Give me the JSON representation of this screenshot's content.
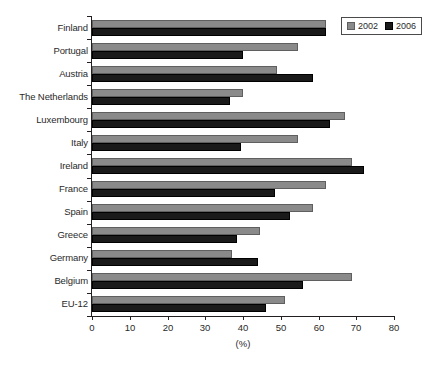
{
  "chart_data": {
    "type": "bar",
    "orientation": "horizontal",
    "title": "",
    "xlabel": "(%)",
    "ylabel": "",
    "xlim": [
      0,
      80
    ],
    "xticks": [
      0,
      10,
      20,
      30,
      40,
      50,
      60,
      70,
      80
    ],
    "grid": false,
    "legend_position": "top-right",
    "categories": [
      "Finland",
      "Portugal",
      "Austria",
      "The Netherlands",
      "Luxembourg",
      "Italy",
      "Ireland",
      "France",
      "Spain",
      "Greece",
      "Germany",
      "Belgium",
      "EU-12"
    ],
    "series": [
      {
        "name": "2002",
        "color": "#8a8a8a",
        "values": [
          62.0,
          54.5,
          49.0,
          40.0,
          67.0,
          54.5,
          69.0,
          62.0,
          58.5,
          44.5,
          37.0,
          69.0,
          51.0
        ]
      },
      {
        "name": "2006",
        "color": "#1a1a1a",
        "values": [
          62.0,
          40.0,
          58.5,
          36.5,
          63.0,
          39.5,
          72.0,
          48.5,
          52.5,
          38.5,
          44.0,
          56.0,
          46.0
        ]
      }
    ]
  },
  "legend": {
    "entries": [
      {
        "label": "2002",
        "swatch": "gray-square-swatch"
      },
      {
        "label": "2006",
        "swatch": "black-square-swatch"
      }
    ]
  },
  "axis": {
    "x_title": "(%)",
    "x_tick_labels": [
      "0",
      "10",
      "20",
      "30",
      "40",
      "50",
      "60",
      "70",
      "80"
    ]
  }
}
